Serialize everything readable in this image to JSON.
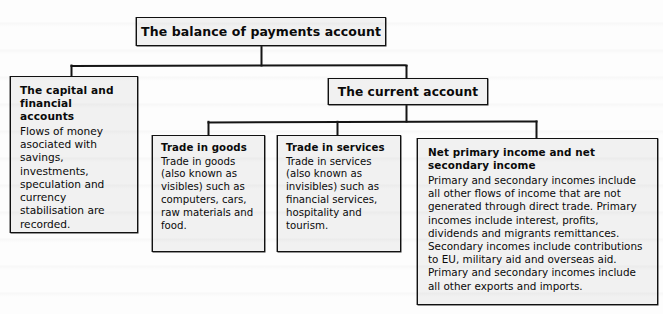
{
  "diagram": {
    "type": "hierarchy-tree",
    "title": "The balance of payments account",
    "root": {
      "id": "root",
      "label": "The balance of payments account"
    },
    "nodes": [
      {
        "id": "capital",
        "title": "The capital and financial accounts",
        "body": "Flows of money asociated with savings, investments, speculation and currency stabilisation are recorded.",
        "level": 2
      },
      {
        "id": "current",
        "title": "The current account",
        "body": "",
        "level": 2
      },
      {
        "id": "goods",
        "title": "Trade in goods",
        "body": "Trade in goods (also known as visibles) such as computers, cars, raw materials and food.",
        "level": 3
      },
      {
        "id": "services",
        "title": "Trade in services",
        "body": "Trade in services (also known as invisibles) such as financial services, hospitality and tourism.",
        "level": 3
      },
      {
        "id": "income",
        "title": "Net primary income and net secondary income",
        "body": "Primary and secondary incomes include all other flows of income that are not generated through direct trade. Primary incomes include interest, profits, dividends and migrants remittances. Secondary incomes include contributions to EU, military aid and overseas aid. Primary and secondary incomes include all other exports and imports.",
        "level": 3
      }
    ],
    "edges": [
      {
        "from": "root",
        "to": "capital"
      },
      {
        "from": "root",
        "to": "current"
      },
      {
        "from": "current",
        "to": "goods"
      },
      {
        "from": "current",
        "to": "services"
      },
      {
        "from": "current",
        "to": "income"
      }
    ],
    "colors": {
      "page_background": "#fdfdfd",
      "box_fill": "#f1f1f1",
      "box_border": "#111111",
      "connector": "#1a1a1a",
      "text": "#0a0a0a"
    }
  }
}
